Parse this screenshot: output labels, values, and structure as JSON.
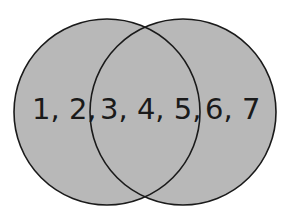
{
  "diagram": {
    "type": "venn",
    "fill_color": "#b8b8b8",
    "stroke_color": "#1a1a1a",
    "sets": [
      {
        "name": "left-set",
        "cx": 107,
        "cy": 112,
        "r": 93
      },
      {
        "name": "right-set",
        "cx": 183,
        "cy": 112,
        "r": 93
      }
    ],
    "regions": {
      "left_only": "1, 2,",
      "intersection": "3, 4, 5,",
      "right_only": "6, 7"
    }
  }
}
